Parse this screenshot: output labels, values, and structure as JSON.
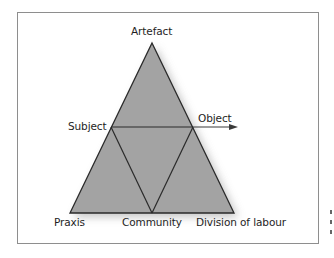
{
  "diagram": {
    "type": "activity-system-triangle",
    "nodes": {
      "artefact": "Artefact",
      "subject": "Subject",
      "object": "Object",
      "praxis": "Praxis",
      "community": "Community",
      "division_of_labour": "Division of labour"
    },
    "edges": [
      {
        "from": "artefact",
        "to": "praxis"
      },
      {
        "from": "artefact",
        "to": "division_of_labour"
      },
      {
        "from": "praxis",
        "to": "division_of_labour"
      },
      {
        "from": "subject",
        "to": "object",
        "arrow": true
      },
      {
        "from": "subject",
        "to": "community"
      },
      {
        "from": "object",
        "to": "community"
      }
    ],
    "colors": {
      "fill": "#a3a3a3",
      "stroke": "#2a2a2a",
      "frame": "#8e8e8e",
      "text": "#1e1e1e",
      "shadow": "#c8c8c8"
    }
  }
}
